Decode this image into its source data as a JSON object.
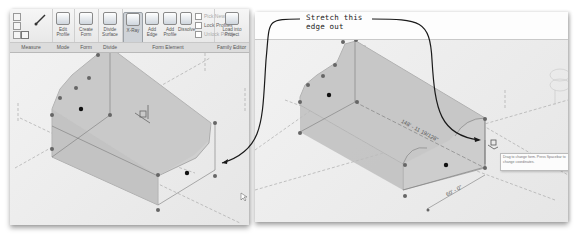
{
  "ribbon": {
    "groups": [
      {
        "label": "Measure"
      },
      {
        "label": "Mode"
      },
      {
        "label": "Form"
      },
      {
        "label": "Divide"
      },
      {
        "label": "Form Element"
      },
      {
        "label": "Family Editor"
      }
    ],
    "buttons": {
      "measure": "Measure",
      "edit_profile": "Edit Profile",
      "create_form": "Create Form",
      "divide_surface": "Divide Surface",
      "x_ray": "X-Ray",
      "add_edge": "Add Edge",
      "add_profile": "Add Profile",
      "dissolve": "Dissolve",
      "pick_new_host": "Pick New Host",
      "lock_profiles": "Lock Profiles",
      "unlock_profiles": "Unlock Profile",
      "load_into_project": "Load into Project"
    }
  },
  "callout": {
    "text": "Stretch this edge out"
  },
  "right_view": {
    "dimension_long": "148' - 11 19/128\"",
    "dimension_short": "60' - 0\"",
    "tooltip": "Drag to change form. Press Spacebar to change coordinates."
  },
  "colors": {
    "viewport_bg": "#ececec",
    "form_fill": "#c8c8c8",
    "control_point": "#555555",
    "selected_point": "#111111",
    "dashed_ref": "#9a9a9a",
    "callout_line": "#1a1a1a"
  }
}
